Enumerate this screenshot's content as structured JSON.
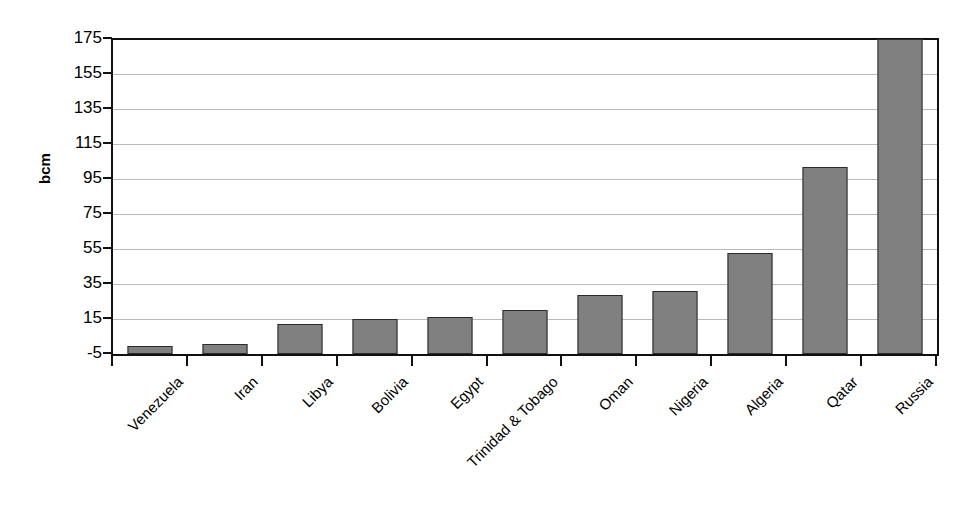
{
  "chart_data": {
    "type": "bar",
    "title": "",
    "subtitle": "",
    "xlabel": "",
    "ylabel": "bcm",
    "ylim": [
      -5,
      175
    ],
    "ytick_step": 20,
    "yticks": [
      175,
      155,
      135,
      115,
      95,
      75,
      55,
      35,
      15,
      -5
    ],
    "ytick_labels": [
      "175",
      "155",
      "135",
      "115",
      "95",
      "75",
      "55",
      "35",
      "15",
      "-5"
    ],
    "grid": true,
    "grid_axis": "y",
    "legend": false,
    "legend_position": "none",
    "bar_color": "#808080",
    "bar_border_color": "#2b2b2b",
    "grid_color": "#b9b9b9",
    "axis_color": "#111111",
    "xtick_label_rotation": -45,
    "categories": [
      "Venezuela",
      "Iran",
      "Libya",
      "Bolivia",
      "Egypt",
      "Trinidad & Tobago",
      "Oman",
      "Nigeria",
      "Algeria",
      "Qatar",
      "Russia"
    ],
    "values": [
      -0.5,
      0.5,
      12,
      15,
      16,
      20,
      29,
      31,
      53,
      102,
      175
    ],
    "series": [
      {
        "name": "bcm",
        "values": [
          -0.5,
          0.5,
          12,
          15,
          16,
          20,
          29,
          31,
          53,
          102,
          175
        ]
      }
    ]
  }
}
